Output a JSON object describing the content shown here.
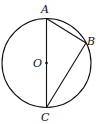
{
  "diagram": {
    "type": "circle-geometry",
    "circle": {
      "center_label": "O",
      "cx": 46.5,
      "cy": 63,
      "r": 44.5
    },
    "points": [
      {
        "label": "A",
        "x": 46.5,
        "y": 18.5,
        "label_x": 41,
        "label_y": 13
      },
      {
        "label": "B",
        "x": 86,
        "y": 43,
        "label_x": 87,
        "label_y": 44
      },
      {
        "label": "C",
        "x": 46.5,
        "y": 107.5,
        "label_x": 41,
        "label_y": 121
      },
      {
        "label": "O",
        "x": 46.5,
        "y": 63,
        "label_x": 33,
        "label_y": 67
      }
    ],
    "segments": [
      {
        "from": "A",
        "to": "C",
        "note": "diameter through O"
      },
      {
        "from": "A",
        "to": "B"
      },
      {
        "from": "B",
        "to": "C"
      }
    ],
    "colors": {
      "stroke": "#111111",
      "background": "#ffffff"
    }
  }
}
